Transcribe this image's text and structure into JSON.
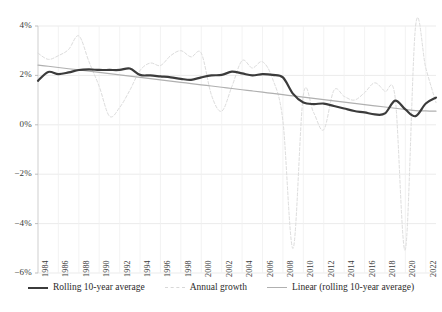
{
  "chart_data": {
    "type": "line",
    "title": "",
    "subtitle": "",
    "xlabel": "",
    "ylabel": "",
    "grid": true,
    "legend_position": "bottom",
    "ylim": [
      -6,
      4
    ],
    "xlim": [
      1984,
      2023
    ],
    "y_ticks": [
      "4%",
      "2%",
      "0%",
      "−2%",
      "−4%",
      "−6%"
    ],
    "y_tick_values": [
      4,
      2,
      0,
      -2,
      -4,
      -6
    ],
    "x_ticks": [
      "1984",
      "1986",
      "1988",
      "1990",
      "1992",
      "1994",
      "1996",
      "1998",
      "2000",
      "2002",
      "2004",
      "2006",
      "2008",
      "2010",
      "2012",
      "2014",
      "2016",
      "2018",
      "2020",
      "2022"
    ],
    "x_tick_values": [
      1984,
      1986,
      1988,
      1990,
      1992,
      1994,
      1996,
      1998,
      2000,
      2002,
      2004,
      2006,
      2008,
      2010,
      2012,
      2014,
      2016,
      2018,
      2020,
      2022
    ],
    "x": [
      1984,
      1985,
      1986,
      1987,
      1988,
      1989,
      1990,
      1991,
      1992,
      1993,
      1994,
      1995,
      1996,
      1997,
      1998,
      1999,
      2000,
      2001,
      2002,
      2003,
      2004,
      2005,
      2006,
      2007,
      2008,
      2009,
      2010,
      2011,
      2012,
      2013,
      2014,
      2015,
      2016,
      2017,
      2018,
      2019,
      2020,
      2021,
      2022,
      2023
    ],
    "series": [
      {
        "name": "Rolling 10-year average",
        "style": "solid",
        "color": "#3b3b3b",
        "width": 2.2,
        "values": [
          1.78,
          2.14,
          2.05,
          2.12,
          2.22,
          2.24,
          2.22,
          2.22,
          2.22,
          2.28,
          2.02,
          2.0,
          1.96,
          1.92,
          1.86,
          1.82,
          1.92,
          2.0,
          2.02,
          2.15,
          2.08,
          2.0,
          2.05,
          2.02,
          1.92,
          1.25,
          0.9,
          0.84,
          0.86,
          0.76,
          0.66,
          0.56,
          0.5,
          0.42,
          0.46,
          0.98,
          0.62,
          0.35,
          0.86,
          1.1
        ]
      },
      {
        "name": "Annual growth",
        "style": "dashed",
        "color": "#dcdcdc",
        "width": 1.0,
        "values": [
          2.9,
          2.65,
          2.8,
          3.05,
          3.6,
          2.55,
          1.55,
          0.35,
          0.7,
          1.4,
          2.2,
          2.5,
          2.4,
          2.8,
          3.0,
          2.75,
          2.9,
          1.2,
          0.55,
          1.55,
          2.6,
          2.3,
          2.55,
          1.85,
          0.15,
          -5.0,
          1.2,
          0.5,
          -0.2,
          1.4,
          1.15,
          1.0,
          1.3,
          1.7,
          1.35,
          1.1,
          -5.05,
          4.0,
          2.3,
          0.9
        ]
      },
      {
        "name": "Linear (rolling 10-year average)",
        "style": "solid",
        "color": "#b0b0b0",
        "width": 1.2,
        "values": [
          2.42,
          2.37,
          2.32,
          2.27,
          2.22,
          2.17,
          2.12,
          2.07,
          2.02,
          1.97,
          1.92,
          1.87,
          1.82,
          1.77,
          1.72,
          1.67,
          1.62,
          1.57,
          1.52,
          1.47,
          1.42,
          1.37,
          1.32,
          1.27,
          1.22,
          1.17,
          1.12,
          1.07,
          1.02,
          0.97,
          0.92,
          0.87,
          0.82,
          0.77,
          0.72,
          0.67,
          0.62,
          0.57,
          0.56,
          0.55
        ]
      }
    ]
  },
  "legend": {
    "items": [
      {
        "label": "Rolling 10-year average"
      },
      {
        "label": "Annual growth"
      },
      {
        "label": "Linear (rolling 10-year average)"
      }
    ]
  },
  "colors": {
    "rolling": "#3b3b3b",
    "annual": "#dcdcdc",
    "linear": "#b0b0b0",
    "grid": "#e6e6e6",
    "text": "#2b2b2b",
    "background": "#ffffff"
  }
}
